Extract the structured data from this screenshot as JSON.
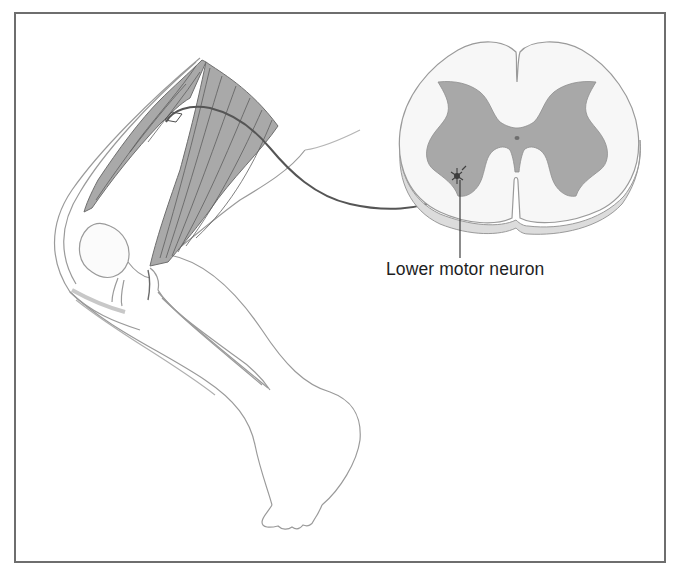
{
  "figure": {
    "annotations": [
      {
        "id": "lower-motor-neuron",
        "text": "Lower motor neuron"
      }
    ],
    "structures": [
      "thigh-muscles",
      "knee",
      "lower-leg",
      "foot",
      "nerve-fiber",
      "spinal-cord-cross-section",
      "gray-matter",
      "central-canal",
      "motor-neuron-cell-body"
    ],
    "colors": {
      "frame": "#6e6e6e",
      "muscle": "#a9a9a9",
      "gray_matter": "#a8a8a8",
      "white_matter": "#f7f7f7",
      "cord_rim": "#dcdcdc",
      "outline": "#9a9a9a",
      "nerve": "#555555",
      "text": "#1e1e1e"
    }
  }
}
